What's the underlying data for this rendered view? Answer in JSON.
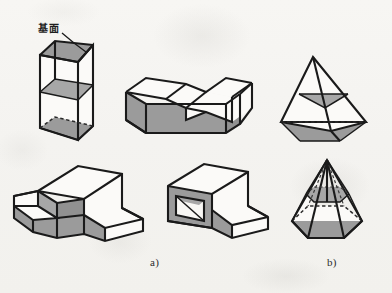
{
  "figure": {
    "kind": "engineering-isometric-solids-plate",
    "medium": "scanned-textbook-page",
    "background_color": "#f6f5f2",
    "ink_color": "#1a1a1a",
    "shade_color": "#9b9b9b",
    "shade_color_light": "#adadad",
    "face_color": "#fbfaf8",
    "width": 392,
    "height": 293,
    "group_count": 2,
    "solid_count": 6
  },
  "annotations": {
    "base_plane_label": "基面",
    "base_plane_label_meaning": "base plane",
    "leader_from": "label-text",
    "leader_to": "prism-top-face"
  },
  "captions": [
    {
      "id": "a",
      "text": "a)",
      "x": 150,
      "y": 262
    },
    {
      "id": "b",
      "text": "b)",
      "x": 327,
      "y": 262
    }
  ],
  "solids": [
    {
      "id": "truncated-prism",
      "name": "Triangular wedge prism with inclined base plane",
      "group": "a",
      "row": "top",
      "column": 1,
      "shaded_faces": [
        "top-inclined-face",
        "mid-section-plane",
        "bottom-inclined-plane"
      ],
      "hidden_edges": true,
      "labelled": true
    },
    {
      "id": "grooved-block",
      "name": "Rectangular block with V-groove slot",
      "group": "a",
      "row": "top",
      "column": 2,
      "shaded_faces": [
        "front-face",
        "left-end-face",
        "groove-inner-face"
      ],
      "hidden_edges": false,
      "labelled": false
    },
    {
      "id": "tetrahedron-section",
      "name": "Triangular pyramid with horizontal cutting plane",
      "group": "b",
      "row": "top",
      "column": 3,
      "shaded_faces": [
        "section-triangle",
        "base-triangle"
      ],
      "hidden_edges": true,
      "labelled": false
    },
    {
      "id": "stepped-notched-block",
      "name": "Stepped block with rectangular notch",
      "group": "a",
      "row": "bottom",
      "column": 1,
      "shaded_faces": [
        "front-face",
        "notch-face",
        "step-riser"
      ],
      "hidden_edges": false,
      "labelled": false
    },
    {
      "id": "stepped-block-with-hole",
      "name": "Stepped block with square through hole",
      "group": "a",
      "row": "bottom",
      "column": 2,
      "shaded_faces": [
        "front-face",
        "step-riser",
        "hole-inner-face"
      ],
      "hidden_edges": false,
      "labelled": false
    },
    {
      "id": "hexagonal-pyramid-section",
      "name": "Hexagonal pyramid with horizontal cutting plane",
      "group": "b",
      "row": "bottom",
      "column": 3,
      "shaded_faces": [
        "section-hexagon",
        "base-hexagon"
      ],
      "hidden_edges": true,
      "labelled": false
    }
  ]
}
